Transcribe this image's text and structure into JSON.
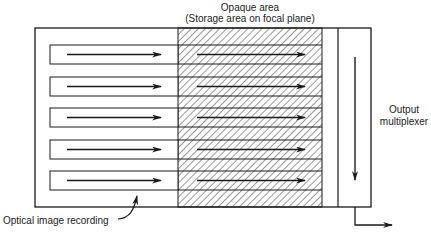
{
  "diagram": {
    "labels": {
      "opaque_title": "Opaque area",
      "opaque_subtitle": "(Storage area on focal plane)",
      "output_line1": "Output",
      "output_line2": "multiplexer",
      "optical": "Optical image recording"
    },
    "regions": [
      {
        "name": "optical-image-area",
        "fill": "white"
      },
      {
        "name": "opaque-storage-area",
        "fill": "hatched"
      },
      {
        "name": "output-multiplexer",
        "fill": "white"
      }
    ],
    "rows": 5,
    "colors": {
      "line": "#1a1a1a",
      "hatch": "#333333",
      "background": "#ffffff"
    }
  }
}
